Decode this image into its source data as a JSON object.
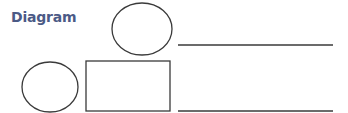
{
  "title": "Diagram",
  "colors": {
    "title": "#4b5a86",
    "stroke": "#3a3a3a"
  },
  "shapes": [
    {
      "type": "ellipse",
      "name": "top-ellipse",
      "cx": 142,
      "cy": 29,
      "rx": 30,
      "ry": 26
    },
    {
      "type": "line",
      "name": "top-line",
      "x1": 178,
      "y1": 45,
      "x2": 333,
      "y2": 45
    },
    {
      "type": "ellipse",
      "name": "left-ellipse",
      "cx": 50,
      "cy": 87,
      "rx": 28,
      "ry": 25
    },
    {
      "type": "rect",
      "name": "rectangle",
      "x": 86,
      "y": 61,
      "w": 84,
      "h": 50
    },
    {
      "type": "line",
      "name": "bottom-line",
      "x1": 178,
      "y1": 111,
      "x2": 333,
      "y2": 111
    }
  ]
}
